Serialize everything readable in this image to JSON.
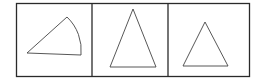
{
  "figure": {
    "panels": [
      {
        "id": "panel-1",
        "shape": "circular-sector",
        "label": ""
      },
      {
        "id": "panel-2",
        "shape": "tall-isosceles-triangle",
        "label": ""
      },
      {
        "id": "panel-3",
        "shape": "isosceles-triangle",
        "label": ""
      }
    ]
  },
  "colors": {
    "stroke": "#333333",
    "background": "#ffffff"
  }
}
